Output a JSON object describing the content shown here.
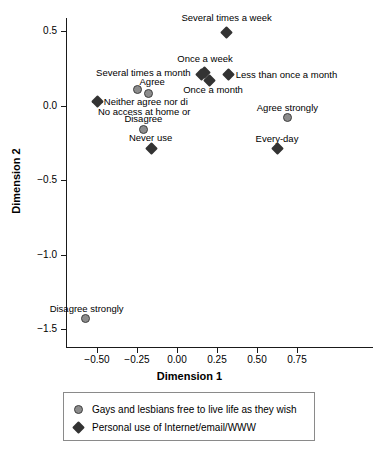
{
  "chart_data": {
    "type": "scatter",
    "title": "",
    "xlabel": "Dimension 1",
    "ylabel": "Dimension 2",
    "xlim": [
      -0.66,
      1.26
    ],
    "ylim": [
      -1.5,
      0.66
    ],
    "grid": false,
    "legend_position": "bottom",
    "xticks": [
      "-0.50",
      "-0.25",
      "0.00",
      "0.25",
      "0.50",
      "0.75"
    ],
    "xtick_values": [
      -0.5,
      -0.25,
      0.0,
      0.25,
      0.5,
      0.75
    ],
    "yticks": [
      "0.5",
      "0.0",
      "-0.5",
      "-1.0",
      "-1.5"
    ],
    "ytick_values": [
      0.5,
      0.0,
      -0.5,
      -1.0,
      -1.5
    ],
    "series": [
      {
        "name": "Gays and lesbians free to live life as they wish",
        "marker": "circle",
        "color": "#8c8c8c",
        "points": [
          {
            "label": "Agree strongly",
            "x": 0.69,
            "y": -0.08,
            "label_pos": "above"
          },
          {
            "label": "Agree",
            "x": -0.18,
            "y": 0.08,
            "label_pos": "above"
          },
          {
            "label": "Neither agree nor di",
            "x": -0.25,
            "y": 0.11,
            "label_pos": "none"
          },
          {
            "label": "Disagree",
            "x": -0.21,
            "y": -0.16,
            "label_pos": "above"
          },
          {
            "label": "Disagree strongly",
            "x": -0.57,
            "y": -1.43,
            "label_pos": "above"
          }
        ]
      },
      {
        "name": "Personal use of Internet/email/WWW",
        "marker": "diamond",
        "color": "#333333",
        "points": [
          {
            "label": "Several times a week",
            "x": 0.31,
            "y": 0.49,
            "label_pos": "above"
          },
          {
            "label": "Once a week",
            "x": 0.17,
            "y": 0.22,
            "label_pos": "above"
          },
          {
            "label": "Several times a month",
            "x": 0.155,
            "y": 0.21,
            "label_pos": "left"
          },
          {
            "label": "Once a month",
            "x": 0.205,
            "y": 0.17,
            "label_pos": "below"
          },
          {
            "label": "Less than once a month",
            "x": 0.32,
            "y": 0.21,
            "label_pos": "right"
          },
          {
            "label": "No access at home or",
            "x": -0.5,
            "y": 0.03,
            "label_pos": "right"
          },
          {
            "label": "Never use",
            "x": -0.16,
            "y": -0.29,
            "label_pos": "above"
          },
          {
            "label": "Every-day",
            "x": 0.63,
            "y": -0.29,
            "label_pos": "above"
          }
        ]
      }
    ],
    "point_labels": [
      {
        "text": "Several times a week",
        "x": 0.31,
        "y": 0.585,
        "align": "center"
      },
      {
        "text": "Once a week",
        "x": 0.175,
        "y": 0.315,
        "align": "center"
      },
      {
        "text": "Several times a month",
        "x": 0.085,
        "y": 0.215,
        "align": "right-end"
      },
      {
        "text": "Less than once a month",
        "x": 0.355,
        "y": 0.21,
        "align": "left-start"
      },
      {
        "text": "Once a month",
        "x": 0.225,
        "y": 0.105,
        "align": "center"
      },
      {
        "text": "Agree",
        "x": -0.155,
        "y": 0.155,
        "align": "center"
      },
      {
        "text": "Neither agree nor di",
        "x": -0.47,
        "y": 0.03,
        "align": "left-start"
      },
      {
        "text": "No access at home or",
        "x": -0.205,
        "y": -0.045,
        "align": "center"
      },
      {
        "text": "Disagree",
        "x": -0.21,
        "y": -0.09,
        "align": "center"
      },
      {
        "text": "Never use",
        "x": -0.165,
        "y": -0.22,
        "align": "center"
      },
      {
        "text": "Agree strongly",
        "x": 0.69,
        "y": -0.015,
        "align": "center"
      },
      {
        "text": "Every-day",
        "x": 0.625,
        "y": -0.225,
        "align": "center"
      },
      {
        "text": "Disagree strongly",
        "x": -0.565,
        "y": -1.365,
        "align": "center"
      }
    ]
  },
  "axes": {
    "x_title": "Dimension 1",
    "y_title": "Dimension 2"
  },
  "legend": {
    "entries": [
      {
        "marker": "circle",
        "label": "Gays and lesbians free to live life as they wish"
      },
      {
        "marker": "diamond",
        "label": "Personal use of Internet/email/WWW"
      }
    ]
  }
}
